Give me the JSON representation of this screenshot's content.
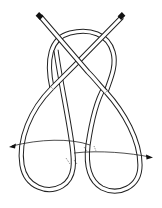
{
  "figure": {
    "title": "",
    "colors": {
      "background": "#ffffff",
      "line": "#222222",
      "end_cap": "#111111"
    },
    "elements": [
      {
        "name": "left-rope-end",
        "label": ""
      },
      {
        "name": "right-rope-end",
        "label": ""
      },
      {
        "name": "top-arch",
        "label": ""
      },
      {
        "name": "left-lobe",
        "label": ""
      },
      {
        "name": "right-lobe",
        "label": ""
      },
      {
        "name": "left-arrow",
        "label": ""
      },
      {
        "name": "right-arrow",
        "label": ""
      }
    ]
  }
}
